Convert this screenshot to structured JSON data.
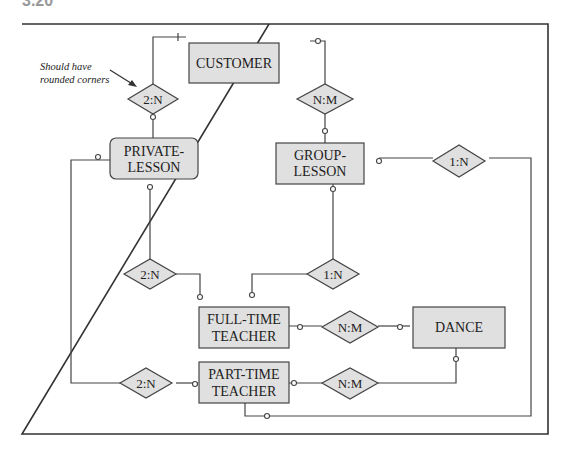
{
  "figure_label": "3.20",
  "annotation": {
    "line1": "Should have",
    "line2": "rounded corners"
  },
  "entities": {
    "customer": {
      "label": "CUSTOMER"
    },
    "private_lesson": {
      "line1": "PRIVATE-",
      "line2": "LESSON"
    },
    "group_lesson": {
      "line1": "GROUP-",
      "line2": "LESSON"
    },
    "full_time_teacher": {
      "line1": "FULL-TIME",
      "line2": "TEACHER"
    },
    "part_time_teacher": {
      "line1": "PART-TIME",
      "line2": "TEACHER"
    },
    "dance": {
      "label": "DANCE"
    }
  },
  "relationships": {
    "customer_private": "2:N",
    "customer_group": "N:M",
    "group_parttime": "1:N",
    "private_fulltime": "2:N",
    "group_fulltime": "1:N",
    "fulltime_dance": "N:M",
    "private_parttime": "2:N",
    "parttime_dance": "N:M"
  }
}
